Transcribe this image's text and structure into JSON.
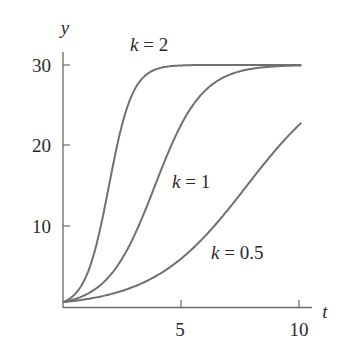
{
  "chart_data": {
    "type": "line",
    "title": "",
    "xlabel": "t",
    "ylabel": "y",
    "xlim": [
      0,
      10
    ],
    "ylim": [
      0,
      30
    ],
    "xticks": [
      5,
      10
    ],
    "yticks": [
      10,
      20,
      30
    ],
    "grid": false,
    "legend": "inline curve labels",
    "model": "y = 30 / (1 + 49 e^(-k t))",
    "series": [
      {
        "name": "k = 2",
        "k": 2,
        "x": [
          0,
          0.5,
          1,
          1.5,
          2,
          2.5,
          3,
          3.5,
          4,
          5,
          6,
          7,
          8,
          9,
          10
        ],
        "values": [
          0.6,
          1.6,
          3.9,
          8.5,
          15.8,
          22.7,
          27.0,
          28.9,
          29.6,
          29.9,
          30.0,
          30.0,
          30.0,
          30.0,
          30.0
        ]
      },
      {
        "name": "k = 1",
        "k": 1,
        "x": [
          0,
          1,
          2,
          3,
          4,
          5,
          6,
          7,
          8,
          9,
          10
        ],
        "values": [
          0.6,
          1.6,
          3.9,
          8.5,
          15.8,
          22.7,
          27.0,
          28.9,
          29.6,
          29.8,
          29.9
        ]
      },
      {
        "name": "k = 0.5",
        "k": 0.5,
        "x": [
          0,
          1,
          2,
          3,
          4,
          5,
          6,
          7,
          8,
          9,
          10
        ],
        "values": [
          0.6,
          1.0,
          1.6,
          2.5,
          3.9,
          5.8,
          8.5,
          11.9,
          15.8,
          19.6,
          22.5
        ]
      }
    ]
  },
  "labels": {
    "ylabel": "y",
    "xlabel": "t",
    "yticks": [
      "10",
      "20",
      "30"
    ],
    "xticks": [
      "5",
      "10"
    ],
    "curve_k2": "k = 2",
    "curve_k1": "k = 1",
    "curve_k05": "k = 0.5"
  },
  "colors": {
    "curve": "#707070",
    "axis": "#6a6a6a",
    "text": "#2a2a2a"
  }
}
